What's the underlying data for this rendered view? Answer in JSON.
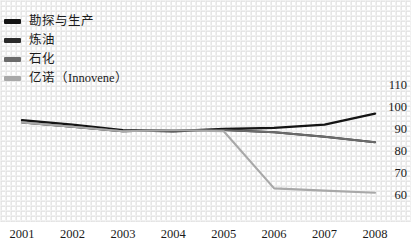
{
  "chart_data": {
    "type": "line",
    "title": "",
    "subtitle": "",
    "xlabel": "",
    "ylabel": "",
    "categories": [
      "2001",
      "2002",
      "2003",
      "2004",
      "2005",
      "2006",
      "2007",
      "2008"
    ],
    "x_tick_labels": [
      "2001",
      "2002",
      "2003",
      "2004",
      "2005",
      "2006",
      "2007",
      "2008"
    ],
    "y_tick_labels": [
      "110",
      "100",
      "90",
      "80",
      "70",
      "60"
    ],
    "y_ticks": [
      110,
      100,
      90,
      80,
      70,
      60
    ],
    "ylim": [
      55,
      113
    ],
    "y_axis_position": "right",
    "grid": "dotted-texture",
    "legend_position": "top-left",
    "series": [
      {
        "name": "勘探与生产",
        "color": "#141414",
        "values": [
          94,
          92,
          89.5,
          89,
          90,
          90.5,
          92,
          97
        ]
      },
      {
        "name": "炼油",
        "color": "#2b2b2b",
        "values": [
          93,
          91,
          89,
          89.5,
          89.5,
          88.5,
          86.5,
          84
        ]
      },
      {
        "name": "石化",
        "color": "#6b6b6b",
        "values": [
          93,
          91,
          89,
          89.5,
          89.5,
          88.5,
          86.5,
          84
        ]
      },
      {
        "name": "亿诺（Innovene）",
        "color": "#a8a8a8",
        "values": [
          93,
          91,
          89,
          89.5,
          89,
          63,
          62,
          61
        ]
      }
    ]
  },
  "legend": {
    "items": [
      {
        "label": "勘探与生产",
        "color": "#141414"
      },
      {
        "label": "炼油",
        "color": "#2b2b2b"
      },
      {
        "label": "石化",
        "color": "#6b6b6b"
      },
      {
        "label": "亿诺（Innovene）",
        "color": "#a8a8a8"
      }
    ]
  }
}
